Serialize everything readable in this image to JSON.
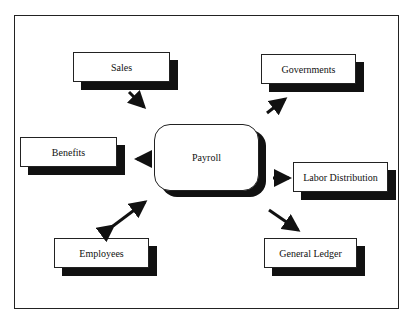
{
  "caption": "Figure: Payroll system interfaces",
  "center": {
    "label": "Payroll"
  },
  "nodes": [
    {
      "id": "sales",
      "label": "Sales",
      "direction": "in"
    },
    {
      "id": "governments",
      "label": "Governments",
      "direction": "out"
    },
    {
      "id": "benefits",
      "label": "Benefits",
      "direction": "out"
    },
    {
      "id": "labor-distribution",
      "label": "Labor Distribution",
      "direction": "out"
    },
    {
      "id": "employees",
      "label": "Employees",
      "direction": "bidirectional"
    },
    {
      "id": "general-ledger",
      "label": "General Ledger",
      "direction": "out"
    }
  ],
  "colors": {
    "stroke": "#222222",
    "shadow": "#111111",
    "background": "#ffffff"
  }
}
